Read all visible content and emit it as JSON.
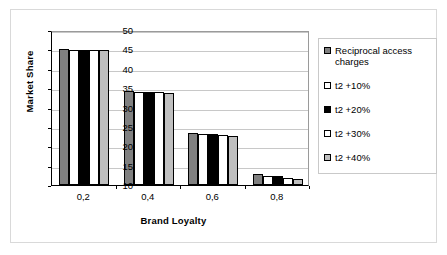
{
  "chart_data": {
    "type": "bar",
    "title": "",
    "xlabel": "Brand Loyalty",
    "ylabel": "Market Share",
    "categories": [
      "0,2",
      "0,4",
      "0,6",
      "0,8"
    ],
    "ylim": [
      10,
      50
    ],
    "yticks": [
      10,
      15,
      20,
      25,
      30,
      35,
      40,
      45,
      50
    ],
    "grid": true,
    "legend_position": "right",
    "series": [
      {
        "name": "Reciprocal access charges",
        "color": "#808080",
        "values": [
          45.0,
          34.2,
          23.5,
          12.8
        ]
      },
      {
        "name": "t2 +10%",
        "color": "#ffffff",
        "values": [
          44.9,
          34.1,
          23.2,
          12.4
        ]
      },
      {
        "name": "t2 +20%",
        "color": "#000000",
        "values": [
          44.9,
          33.9,
          23.1,
          12.3
        ]
      },
      {
        "name": "t2 +30%",
        "color": "#ffffff",
        "values": [
          44.9,
          33.9,
          22.9,
          11.8
        ]
      },
      {
        "name": "t2 +40%",
        "color": "#bfbfbf",
        "values": [
          44.9,
          33.8,
          22.7,
          11.6
        ]
      }
    ]
  }
}
